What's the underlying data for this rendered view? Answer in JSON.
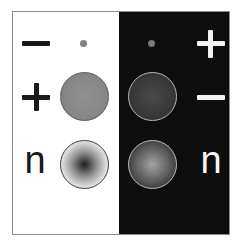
{
  "figure": {
    "panels": [
      {
        "id": "light",
        "background": "#ffffff",
        "ink": "#1a1a1a",
        "rows": [
          {
            "label": "−",
            "symbol": "minus-icon",
            "particle": "small-dot",
            "particle_color": "#808080"
          },
          {
            "label": "+",
            "symbol": "plus-icon",
            "particle": "uniform-gray-disc",
            "particle_color": "#878787"
          },
          {
            "label": "n",
            "symbol": "letter-n",
            "particle": "dark-center-radial-disc",
            "particle_color": "#1e1e1e"
          }
        ]
      },
      {
        "id": "dark",
        "background": "#0d0d0d",
        "ink": "#f2f2f2",
        "rows": [
          {
            "label": "+",
            "symbol": "plus-icon",
            "particle": "small-dot",
            "particle_color": "#7a7a7a"
          },
          {
            "label": "−",
            "symbol": "minus-icon",
            "particle": "dark-gray-disc",
            "particle_color": "#3a3a3a"
          },
          {
            "label": "n",
            "symbol": "letter-n",
            "particle": "light-center-radial-disc",
            "particle_color": "#a4a4a4"
          }
        ]
      }
    ],
    "labels": {
      "light_row3": "n",
      "dark_row3": "n"
    },
    "colors": {
      "frame_border": "#8c8c8c",
      "light_bg": "#ffffff",
      "dark_bg": "#0d0d0d",
      "dark_ink": "#1a1a1a",
      "light_ink": "#f2f2f2"
    }
  }
}
